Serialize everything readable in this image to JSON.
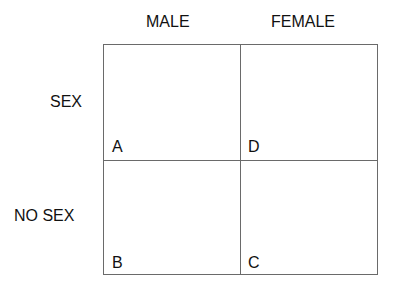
{
  "columns": [
    "MALE",
    "FEMALE"
  ],
  "rows": [
    "SEX",
    "NO SEX"
  ],
  "cells": {
    "sex_male": "A",
    "sex_female": "D",
    "nosex_male": "B",
    "nosex_female": "C"
  }
}
